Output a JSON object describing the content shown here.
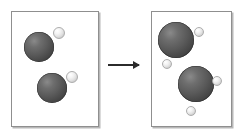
{
  "diagram": {
    "colors": {
      "background": "#ffffff",
      "box_border": "#8f8f8f",
      "box_shadow": "#b8b8b8",
      "large_sphere": "#5a5a5a",
      "small_sphere": "#e8e8e8",
      "arrow": "#2b2b2b"
    },
    "boxes": [
      {
        "name": "before",
        "label": "Left container (before)",
        "x": 11,
        "y": 11,
        "width": 88,
        "height": 116,
        "spheres": [
          {
            "kind": "large",
            "name": "large-sphere-1",
            "cx": 39,
            "cy": 47,
            "r": 15
          },
          {
            "kind": "small",
            "name": "small-sphere-1",
            "cx": 59,
            "cy": 33,
            "r": 6
          },
          {
            "kind": "large",
            "name": "large-sphere-2",
            "cx": 52,
            "cy": 88,
            "r": 15
          },
          {
            "kind": "small",
            "name": "small-sphere-2",
            "cx": 72,
            "cy": 77,
            "r": 6
          }
        ]
      },
      {
        "name": "after",
        "label": "Right container (after)",
        "x": 151,
        "y": 11,
        "width": 81,
        "height": 116,
        "spheres": [
          {
            "kind": "large",
            "name": "large-sphere-3",
            "cx": 176,
            "cy": 40,
            "r": 18
          },
          {
            "kind": "small",
            "name": "small-sphere-3",
            "cx": 199,
            "cy": 32,
            "r": 5
          },
          {
            "kind": "small",
            "name": "small-sphere-4",
            "cx": 167,
            "cy": 64,
            "r": 5
          },
          {
            "kind": "large",
            "name": "large-sphere-4",
            "cx": 196,
            "cy": 84,
            "r": 18
          },
          {
            "kind": "small",
            "name": "small-sphere-5",
            "cx": 217,
            "cy": 81,
            "r": 5
          },
          {
            "kind": "small",
            "name": "small-sphere-6",
            "cx": 191,
            "cy": 111,
            "r": 5
          }
        ]
      }
    ],
    "arrow": {
      "name": "reaction-arrow",
      "x": 108,
      "y": 64,
      "length": 31,
      "direction": "right"
    }
  }
}
